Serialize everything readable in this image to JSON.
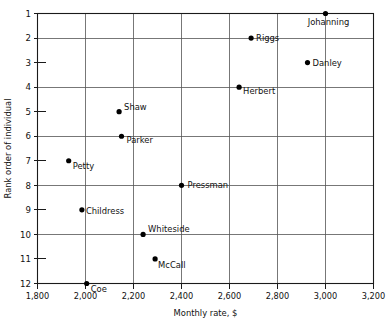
{
  "chart_data": {
    "type": "scatter",
    "title": "",
    "xlabel": "Monthly rate, $",
    "ylabel": "Rank order of individual",
    "xlim": [
      1800,
      3200
    ],
    "ylim": [
      1,
      12
    ],
    "y_inverted": true,
    "grid": true,
    "legend": "none",
    "xticks": [
      1800,
      2000,
      2200,
      2400,
      2600,
      2800,
      3000,
      3200
    ],
    "xticklabels": [
      "1,800",
      "2,000",
      "2,200",
      "2,400",
      "2,600",
      "2,800",
      "3,000",
      "3,200"
    ],
    "yticks": [
      1,
      2,
      3,
      4,
      5,
      6,
      7,
      8,
      9,
      10,
      11,
      12
    ],
    "yticklabels": [
      "1",
      "2",
      "3",
      "4",
      "5",
      "6",
      "7",
      "8",
      "9",
      "10",
      "11",
      "12"
    ],
    "x_gridlines": [
      2000,
      2200,
      2400,
      2600,
      2800,
      3000
    ],
    "y_gridlines": [
      2,
      4,
      6,
      8,
      10,
      12
    ],
    "points": [
      {
        "label": "Johanning",
        "x": 3000,
        "y": 1,
        "label_dx": 3,
        "label_dy": 11,
        "label_anchor": "middle"
      },
      {
        "label": "Riggs",
        "x": 2690,
        "y": 2,
        "label_dx": 5,
        "label_dy": 3,
        "label_anchor": "start"
      },
      {
        "label": "Danley",
        "x": 2925,
        "y": 3,
        "label_dx": 5,
        "label_dy": 3,
        "label_anchor": "start"
      },
      {
        "label": "Herbert",
        "x": 2640,
        "y": 4,
        "label_dx": 4,
        "label_dy": 7,
        "label_anchor": "start"
      },
      {
        "label": "Shaw",
        "x": 2140,
        "y": 5,
        "label_dx": 5,
        "label_dy": -2,
        "label_anchor": "start"
      },
      {
        "label": "Parker",
        "x": 2150,
        "y": 6,
        "label_dx": 5,
        "label_dy": 7,
        "label_anchor": "start"
      },
      {
        "label": "Petty",
        "x": 1930,
        "y": 7,
        "label_dx": 4,
        "label_dy": 8,
        "label_anchor": "start"
      },
      {
        "label": "Pressman",
        "x": 2400,
        "y": 8,
        "label_dx": 6,
        "label_dy": 3,
        "label_anchor": "start"
      },
      {
        "label": "Childress",
        "x": 1985,
        "y": 9,
        "label_dx": 4,
        "label_dy": 4,
        "label_anchor": "start"
      },
      {
        "label": "Whiteside",
        "x": 2240,
        "y": 10,
        "label_dx": 5,
        "label_dy": -2,
        "label_anchor": "start"
      },
      {
        "label": "McCall",
        "x": 2290,
        "y": 11,
        "label_dx": 3,
        "label_dy": 9,
        "label_anchor": "start"
      },
      {
        "label": "Coe",
        "x": 2005,
        "y": 12,
        "label_dx": 4,
        "label_dy": 8,
        "label_anchor": "start"
      }
    ]
  },
  "colors": {
    "point": "#000000",
    "grid": "#555555",
    "frame": "#1a1a1a",
    "text": "#111111",
    "background": "#ffffff"
  }
}
